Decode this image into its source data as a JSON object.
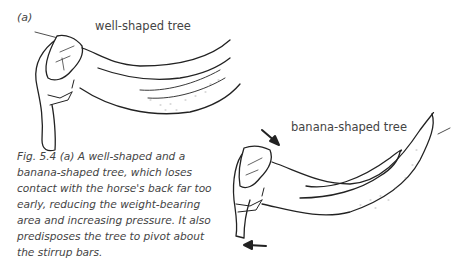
{
  "figure": {
    "panel_label": "(a)",
    "labels": {
      "well_shaped": "well-shaped tree",
      "banana_shaped": "banana-shaped tree"
    },
    "caption": "Fig. 5.4 (a) A well-shaped and a banana-shaped tree, which loses contact with the horse's back far too early, reducing the weight-bearing area and increasing pressure. It also predisposes the tree to pivot about the stirrup bars.",
    "illustrations": [
      {
        "name": "well-shaped saddle tree drawing"
      },
      {
        "name": "banana-shaped saddle tree drawing",
        "arrows": [
          "rotation arrow down-right at pommel",
          "rotation arrow left at base"
        ]
      }
    ],
    "colors": {
      "ink": "#222222",
      "text": "#444444",
      "background": "#ffffff"
    }
  }
}
